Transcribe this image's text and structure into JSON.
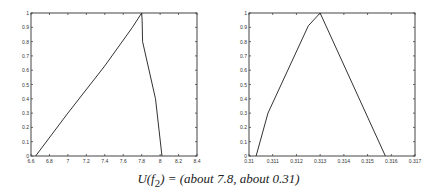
{
  "chart_data": [
    {
      "type": "line",
      "title": "",
      "xlabel": "",
      "ylabel": "",
      "xlim": [
        6.6,
        8.4
      ],
      "ylim": [
        0,
        1
      ],
      "xticks": [
        "6.6",
        "6.8",
        "7",
        "7.2",
        "7.4",
        "7.6",
        "7.8",
        "8",
        "8.2",
        "8.4"
      ],
      "yticks": [
        "0",
        "0.1",
        "0.2",
        "0.3",
        "0.4",
        "0.5",
        "0.6",
        "0.7",
        "0.8",
        "0.9",
        "1"
      ],
      "grid": false,
      "series": [
        {
          "name": "membership",
          "x": [
            6.65,
            7.0,
            7.4,
            7.7,
            7.8,
            7.805,
            7.81,
            7.95,
            8.02
          ],
          "y": [
            0.0,
            0.3,
            0.63,
            0.9,
            1.0,
            0.95,
            0.8,
            0.4,
            0.0
          ]
        }
      ]
    },
    {
      "type": "line",
      "title": "",
      "xlabel": "",
      "ylabel": "",
      "xlim": [
        0.31,
        0.317
      ],
      "ylim": [
        0,
        1
      ],
      "xticks": [
        "0.31",
        "0.311",
        "0.312",
        "0.313",
        "0.314",
        "0.315",
        "0.316",
        "0.317"
      ],
      "yticks": [
        "0",
        "0.1",
        "0.2",
        "0.3",
        "0.4",
        "0.5",
        "0.6",
        "0.7",
        "0.8",
        "0.9",
        "1"
      ],
      "grid": false,
      "series": [
        {
          "name": "membership",
          "x": [
            0.3103,
            0.3108,
            0.3125,
            0.313,
            0.31575
          ],
          "y": [
            0.0,
            0.3,
            0.91,
            1.0,
            0.0
          ]
        }
      ]
    }
  ],
  "caption": {
    "prefix": "U(f",
    "subscript": "2",
    "suffix": ") = (about 7.8, about 0.31)"
  }
}
